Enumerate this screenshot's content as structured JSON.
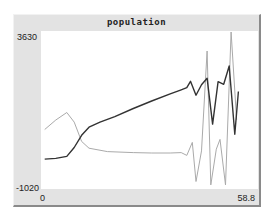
{
  "chart_data": {
    "type": "line",
    "title": "population",
    "xlabel": "",
    "ylabel": "",
    "xlim": [
      0,
      58.8
    ],
    "ylim": [
      -1020,
      3630
    ],
    "x_tick_labels": [
      "0",
      "58.8"
    ],
    "y_tick_labels": [
      "3630",
      "-1020"
    ],
    "grid": false,
    "legend": null,
    "series": [
      {
        "name": "series-dark",
        "color": "#333333",
        "points": [
          [
            1,
            -140
          ],
          [
            4,
            -120
          ],
          [
            7,
            -60
          ],
          [
            9,
            200
          ],
          [
            11,
            560
          ],
          [
            13,
            800
          ],
          [
            16,
            950
          ],
          [
            20,
            1110
          ],
          [
            25,
            1350
          ],
          [
            30,
            1570
          ],
          [
            35,
            1780
          ],
          [
            38,
            1900
          ],
          [
            39.5,
            1960
          ],
          [
            40.5,
            2150
          ],
          [
            42,
            1740
          ],
          [
            43.5,
            2050
          ],
          [
            45,
            2240
          ],
          [
            46.5,
            890
          ],
          [
            48,
            2140
          ],
          [
            49.5,
            2060
          ],
          [
            51,
            2600
          ],
          [
            52.5,
            590
          ],
          [
            53.5,
            1850
          ]
        ]
      },
      {
        "name": "series-light",
        "color": "#aaaaaa",
        "points": [
          [
            1,
            730
          ],
          [
            4,
            1010
          ],
          [
            7,
            1230
          ],
          [
            9,
            950
          ],
          [
            11,
            380
          ],
          [
            13,
            180
          ],
          [
            18,
            80
          ],
          [
            25,
            50
          ],
          [
            30,
            40
          ],
          [
            35,
            40
          ],
          [
            38,
            50
          ],
          [
            39.5,
            -30
          ],
          [
            41,
            350
          ],
          [
            42,
            -800
          ],
          [
            43.5,
            100
          ],
          [
            45,
            3040
          ],
          [
            46,
            -900
          ],
          [
            47.5,
            150
          ],
          [
            48.5,
            440
          ],
          [
            50,
            -900
          ],
          [
            51.5,
            3600
          ],
          [
            53,
            1020
          ]
        ]
      }
    ]
  },
  "labels": {
    "title": "population",
    "y_max": "3630",
    "y_min": "-1020",
    "x_min": "0",
    "x_max": "58.8"
  }
}
